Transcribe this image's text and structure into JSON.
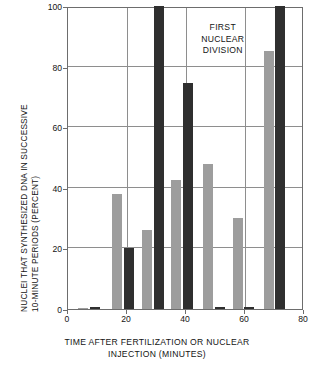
{
  "chart_data": {
    "type": "bar",
    "title": "",
    "xlabel": "TIME AFTER FERTILIZATION OR NUCLEAR INJECTION (MINUTES)",
    "xlabel_line1": "TIME AFTER FERTILIZATION OR NUCLEAR",
    "xlabel_line2": "INJECTION (MINUTES)",
    "ylabel": "NUCLEI THAT SYNTHESIZED DNA IN SUCCESSIVE 10-MINUTE PERIODS (PERCENT)",
    "ylabel_line1": "NUCLEI THAT SYNTHESIZED DNA IN SUCCESSIVE",
    "ylabel_line2": "10-MINUTE PERIODS (PERCENT)",
    "xlim": [
      0,
      80
    ],
    "ylim": [
      0,
      100
    ],
    "grid": true,
    "xticks": [
      0,
      20,
      40,
      60,
      80
    ],
    "yticks": [
      0,
      20,
      40,
      60,
      80,
      100
    ],
    "xticklabels": [
      "0",
      "20",
      "40",
      "60",
      "80"
    ],
    "yticklabels": [
      "0",
      "20",
      "40",
      "60",
      "80",
      "100"
    ],
    "legend": "none",
    "annotations": [
      {
        "text": "FIRST NUCLEAR DIVISION",
        "line1": "FIRST",
        "line2": "NUCLEAR",
        "line3": "DIVISION",
        "x": 56,
        "y": 94
      }
    ],
    "colors": {
      "series_gray": "#9d9d9d",
      "series_dark": "#2f2f2f",
      "axis": "#6d6d6d",
      "grid": "#8e8e8e",
      "background": "#ffffff"
    },
    "series": [
      {
        "name": "gray",
        "color": "#9d9d9d",
        "bars": [
          {
            "x": 5,
            "value": 0,
            "width": 3.4
          },
          {
            "x": 16.7,
            "value": 38,
            "width": 3.4
          },
          {
            "x": 26.8,
            "value": 26,
            "width": 3.4
          },
          {
            "x": 36.5,
            "value": 42.5,
            "width": 3.4
          },
          {
            "x": 47.5,
            "value": 48,
            "width": 3.4
          },
          {
            "x": 57.5,
            "value": 30,
            "width": 3.4
          },
          {
            "x": 68.0,
            "value": 85,
            "width": 3.4
          }
        ]
      },
      {
        "name": "dark",
        "color": "#2f2f2f",
        "bars": [
          {
            "x": 9,
            "value": 0.7,
            "width": 3.4
          },
          {
            "x": 20.6,
            "value": 20,
            "width": 3.4
          },
          {
            "x": 30.8,
            "value": 100,
            "width": 3.4
          },
          {
            "x": 40.6,
            "value": 74.5,
            "width": 3.4
          },
          {
            "x": 51.5,
            "value": 0.7,
            "width": 3.4
          },
          {
            "x": 61.5,
            "value": 0.7,
            "width": 3.4
          },
          {
            "x": 72.0,
            "value": 100,
            "width": 3.4
          }
        ]
      }
    ]
  }
}
